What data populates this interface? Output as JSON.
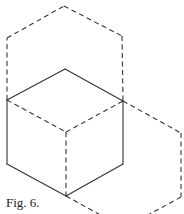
{
  "figure": {
    "caption": "Fig. 6.",
    "stroke_color": "#333333",
    "background": "#ffffff",
    "solid_edges": [
      {
        "id": "cube-top-left",
        "x1": 7,
        "y1": 100,
        "x2": 65,
        "y2": 69
      },
      {
        "id": "cube-top-right",
        "x1": 65,
        "y1": 69,
        "x2": 123,
        "y2": 101
      },
      {
        "id": "cube-left",
        "x1": 7,
        "y1": 100,
        "x2": 7,
        "y2": 164
      },
      {
        "id": "cube-right",
        "x1": 123,
        "y1": 101,
        "x2": 123,
        "y2": 164
      },
      {
        "id": "cube-bottom-left",
        "x1": 7,
        "y1": 164,
        "x2": 66,
        "y2": 196
      },
      {
        "id": "cube-bottom-right",
        "x1": 66,
        "y1": 196,
        "x2": 123,
        "y2": 164
      }
    ],
    "dashed_edges": [
      {
        "id": "hidden-left",
        "x1": 7,
        "y1": 100,
        "x2": 66,
        "y2": 132
      },
      {
        "id": "hidden-right",
        "x1": 66,
        "y1": 132,
        "x2": 123,
        "y2": 101
      },
      {
        "id": "hidden-vertical",
        "x1": 66,
        "y1": 132,
        "x2": 66,
        "y2": 196
      },
      {
        "id": "upper-hex-left",
        "x1": 7,
        "y1": 100,
        "x2": 7,
        "y2": 38
      },
      {
        "id": "upper-hex-top-left",
        "x1": 7,
        "y1": 38,
        "x2": 64,
        "y2": 6
      },
      {
        "id": "upper-hex-top-right",
        "x1": 64,
        "y1": 6,
        "x2": 122,
        "y2": 36
      },
      {
        "id": "upper-hex-right",
        "x1": 122,
        "y1": 36,
        "x2": 123,
        "y2": 101
      },
      {
        "id": "right-hex-top",
        "x1": 123,
        "y1": 101,
        "x2": 181,
        "y2": 133
      },
      {
        "id": "right-hex-right",
        "x1": 181,
        "y1": 133,
        "x2": 181,
        "y2": 197
      },
      {
        "id": "right-hex-bottom-right",
        "x1": 181,
        "y1": 197,
        "x2": 124,
        "y2": 228
      },
      {
        "id": "right-hex-bottom-left",
        "x1": 66,
        "y1": 196,
        "x2": 124,
        "y2": 228
      }
    ]
  }
}
